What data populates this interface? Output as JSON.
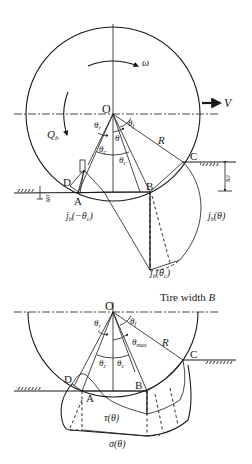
{
  "top_diagram": {
    "center_label": "O",
    "rotation_label": "ω",
    "velocity_label": "V",
    "torque_label": "Q",
    "torque_sub": "b",
    "radius_label": "R",
    "angle_r": "θ",
    "angle_r_sub": "r",
    "angle_f": "θ",
    "angle_f_sub": "f",
    "angle_theta": "θ",
    "angle_c1": "θ",
    "angle_c1_sub": "c",
    "angle_c2": "θ",
    "angle_c2_sub": "c",
    "point_a": "A",
    "point_b": "B",
    "point_c": "C",
    "point_d": "D",
    "sinkage_front": "s",
    "sinkage_front_sub": "0",
    "sinkage_rear": "u",
    "sinkage_rear_sub": "0",
    "curve_jb_neg": "j",
    "curve_jb_neg_sub": "b",
    "curve_jb_neg_arg": "(−θ",
    "curve_jb_neg_arg_sub": "c",
    "curve_jb_neg_close": ")",
    "curve_jb": "j",
    "curve_jb_sub": "b",
    "curve_jb_arg": "(θ)",
    "curve_jbc": "j",
    "curve_jbc_sub": "b",
    "curve_jbc_arg": "(θ",
    "curve_jbc_arg_sub": "c",
    "curve_jbc_close": ")"
  },
  "bottom_diagram": {
    "tire_width_text": "Tire width ",
    "tire_width_symbol": "B",
    "center_label": "O",
    "radius_label": "R",
    "angle_r": "θ",
    "angle_r_sub": "r",
    "angle_f": "θ",
    "angle_f_sub": "f",
    "angle_max": "θ",
    "angle_max_sub": "max",
    "angle_c1": "θ",
    "angle_c1_sub": "c",
    "angle_c2": "θ",
    "angle_c2_sub": "c",
    "point_a": "A",
    "point_b": "B",
    "point_c": "C",
    "point_d": "D",
    "shear_label": "τ(θ)",
    "normal_label": "σ(θ)"
  }
}
